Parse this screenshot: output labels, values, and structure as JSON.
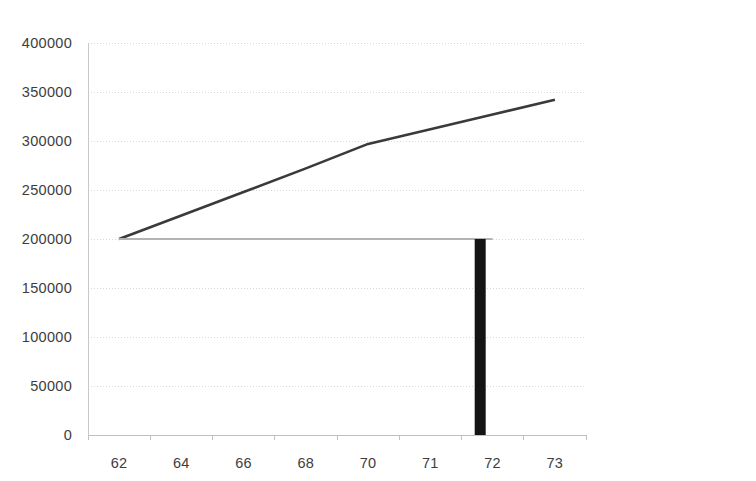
{
  "chart_data": {
    "type": "line",
    "title": "",
    "subtitle": "",
    "xlabel": "",
    "ylabel": "",
    "categories": [
      "62",
      "64",
      "66",
      "68",
      "70",
      "71",
      "72",
      "73"
    ],
    "xlim_categories": 8,
    "ylim": [
      0,
      400000
    ],
    "ytick_labels": [
      "0",
      "50000",
      "100000",
      "150000",
      "200000",
      "250000",
      "300000",
      "350000",
      "400000"
    ],
    "ytick_values": [
      0,
      50000,
      100000,
      150000,
      200000,
      250000,
      300000,
      350000,
      400000
    ],
    "grid": true,
    "grid_axis": "y",
    "legend_position": "right",
    "series": [
      {
        "name": "HECM LOC",
        "color": "#3a3a3a",
        "values": [
          200000,
          224000,
          248000,
          272000,
          297000,
          312000,
          327000,
          342000
        ]
      },
      {
        "name": "HELOC",
        "color": "#b3b3b3",
        "values": [
          200000,
          200000,
          200000,
          200000,
          200000,
          200000,
          200000,
          null
        ]
      }
    ],
    "annotations": [
      {
        "type": "bar",
        "name": "vertical-bar-marker",
        "color": "#141414",
        "x_category_index": 5.8,
        "y_from": 0,
        "y_to": 200000
      }
    ]
  },
  "legend": {
    "items": [
      {
        "label": "HECM LOC",
        "color": "#3a3a3a"
      },
      {
        "label": "HELOC",
        "color": "#b3b3b3"
      }
    ]
  }
}
